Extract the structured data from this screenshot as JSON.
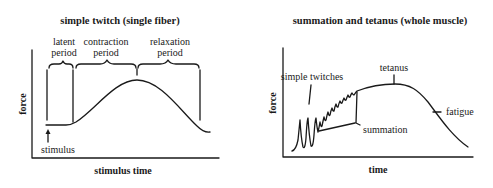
{
  "left_panel": {
    "title": "simple twitch (single fiber)",
    "ylabel": "force",
    "xlabel": "stimulus time",
    "phases": [
      {
        "line1": "latent",
        "line2": "period"
      },
      {
        "line1": "contraction",
        "line2": "period"
      },
      {
        "line1": "relaxation",
        "line2": "period"
      }
    ],
    "stimulus_label": "stimulus"
  },
  "right_panel": {
    "title": "summation and tetanus (whole muscle)",
    "ylabel": "force",
    "xlabel": "time",
    "annotations": {
      "simple_twitches": "simple twitches",
      "tetanus": "tetanus",
      "summation": "summation",
      "fatigue": "fatigue"
    }
  },
  "colors": {
    "ink": "#1a1a1a",
    "background": "#ffffff"
  }
}
